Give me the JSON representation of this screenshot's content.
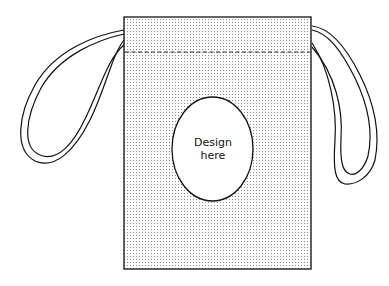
{
  "diagram": {
    "design_area": {
      "line1": "Design",
      "line2": "here"
    },
    "colors": {
      "stroke": "#111111",
      "dots": "#8a8a8a",
      "background": "#ffffff"
    }
  }
}
